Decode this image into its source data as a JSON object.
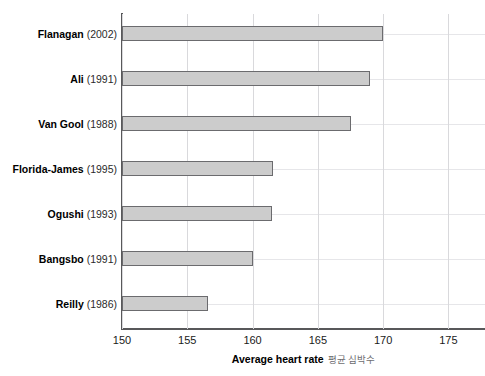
{
  "chart_data": {
    "type": "bar",
    "orientation": "horizontal",
    "title": "",
    "xlabel": "Average heart rate",
    "xlabel_secondary": "평균 심박수",
    "ylabel": "",
    "xlim": [
      150,
      177.8
    ],
    "ylim": null,
    "grid": true,
    "legend": false,
    "xticks": [
      150,
      155,
      160,
      165,
      170,
      175
    ],
    "xtick_labels": [
      "150",
      "155",
      "160",
      "165",
      "170",
      "175"
    ],
    "categories": [
      "Flanagan (2002)",
      "Ali (1991)",
      "Van Gool (1988)",
      "Florida-James (1995)",
      "Ogushi (1993)",
      "Bangsbo (1991)",
      "Reilly (1986)"
    ],
    "category_parts": [
      {
        "name": "Flanagan",
        "year": "(2002)"
      },
      {
        "name": "Ali",
        "year": "(1991)"
      },
      {
        "name": "Van Gool",
        "year": "(1988)"
      },
      {
        "name": "Florida-James",
        "year": "(1995)"
      },
      {
        "name": "Ogushi",
        "year": "(1993)"
      },
      {
        "name": "Bangsbo",
        "year": "(1991)"
      },
      {
        "name": "Reilly",
        "year": "(1986)"
      }
    ],
    "values": [
      170.0,
      169.0,
      167.5,
      161.6,
      161.5,
      160.0,
      156.6
    ],
    "bar_color": "#cccccc",
    "bar_edge_color": "#6b6b6e",
    "grid_color": "#d9d9dc",
    "axis_color": "#58585a",
    "background": "#ffffff"
  }
}
